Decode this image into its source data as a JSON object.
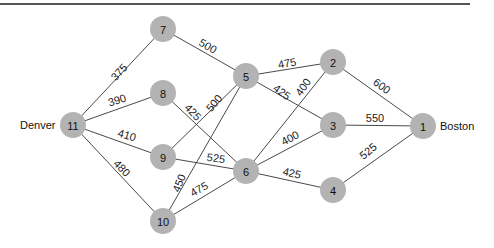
{
  "diagram": {
    "type": "network",
    "node_color": "#b3b3b3",
    "edge_color": "#4a4a4a",
    "city_labels": [
      {
        "text": "Denver",
        "node": "11",
        "x": 20,
        "y": 125,
        "anchor": "start"
      },
      {
        "text": "Boston",
        "node": "1",
        "x": 440,
        "y": 126,
        "anchor": "start"
      }
    ],
    "nodes": [
      {
        "id": "1",
        "x": 423,
        "y": 126
      },
      {
        "id": "2",
        "x": 333,
        "y": 62
      },
      {
        "id": "3",
        "x": 333,
        "y": 125
      },
      {
        "id": "4",
        "x": 333,
        "y": 190
      },
      {
        "id": "5",
        "x": 246,
        "y": 76
      },
      {
        "id": "6",
        "x": 246,
        "y": 171
      },
      {
        "id": "7",
        "x": 163,
        "y": 29
      },
      {
        "id": "8",
        "x": 163,
        "y": 93
      },
      {
        "id": "9",
        "x": 163,
        "y": 157
      },
      {
        "id": "10",
        "x": 163,
        "y": 221
      },
      {
        "id": "11",
        "x": 73,
        "y": 125
      }
    ],
    "edges": [
      {
        "from": "11",
        "to": "7",
        "weight": "375",
        "lx": 119,
        "ly": 72,
        "angle": -47
      },
      {
        "from": "11",
        "to": "8",
        "weight": "390",
        "lx": 117,
        "ly": 100,
        "angle": -17
      },
      {
        "from": "11",
        "to": "9",
        "weight": "410",
        "lx": 127,
        "ly": 135,
        "angle": 17
      },
      {
        "from": "11",
        "to": "10",
        "weight": "480",
        "lx": 122,
        "ly": 168,
        "angle": 46
      },
      {
        "from": "7",
        "to": "5",
        "weight": "500",
        "lx": 208,
        "ly": 46,
        "angle": 30
      },
      {
        "from": "8",
        "to": "6",
        "weight": "425",
        "lx": 193,
        "ly": 112,
        "angle": 46
      },
      {
        "from": "9",
        "to": "5",
        "weight": "500",
        "lx": 214,
        "ly": 103,
        "angle": -50
      },
      {
        "from": "9",
        "to": "6",
        "weight": "525",
        "lx": 216,
        "ly": 158,
        "angle": 8
      },
      {
        "from": "10",
        "to": "5",
        "weight": "450",
        "lx": 179,
        "ly": 183,
        "angle": -68
      },
      {
        "from": "10",
        "to": "6",
        "weight": "475",
        "lx": 199,
        "ly": 189,
        "angle": -30
      },
      {
        "from": "5",
        "to": "2",
        "weight": "475",
        "lx": 287,
        "ly": 63,
        "angle": -10
      },
      {
        "from": "5",
        "to": "3",
        "weight": "425",
        "lx": 282,
        "ly": 92,
        "angle": 36
      },
      {
        "from": "6",
        "to": "2",
        "weight": "400",
        "lx": 303,
        "ly": 87,
        "angle": -55
      },
      {
        "from": "6",
        "to": "3",
        "weight": "400",
        "lx": 290,
        "ly": 138,
        "angle": -28
      },
      {
        "from": "6",
        "to": "4",
        "weight": "425",
        "lx": 292,
        "ly": 173,
        "angle": 13
      },
      {
        "from": "2",
        "to": "1",
        "weight": "600",
        "lx": 382,
        "ly": 86,
        "angle": 36
      },
      {
        "from": "3",
        "to": "1",
        "weight": "550",
        "lx": 375,
        "ly": 118,
        "angle": 0
      },
      {
        "from": "4",
        "to": "1",
        "weight": "525",
        "lx": 368,
        "ly": 151,
        "angle": -40
      }
    ]
  }
}
